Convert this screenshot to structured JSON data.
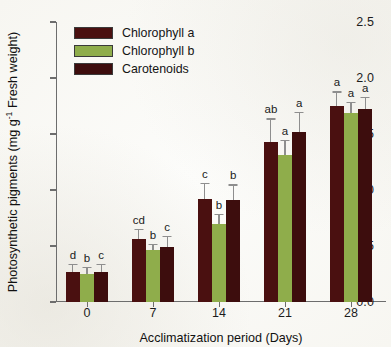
{
  "chart_data": {
    "type": "bar",
    "title": "",
    "xlabel": "Acclimatization period (Days)",
    "ylabel_text": "Photosynthetic pigments (mg g",
    "ylabel_sup": "-1",
    "ylabel_tail": " Fresh weight)",
    "categories": [
      "0",
      "7",
      "14",
      "21",
      "28"
    ],
    "ylim": [
      0.0,
      2.5
    ],
    "ytick_labels": [
      "0.0",
      "0.5",
      "1.0",
      "1.5",
      "2.0",
      "2.5"
    ],
    "ytick_values": [
      0.0,
      0.5,
      1.0,
      1.5,
      2.0,
      2.5
    ],
    "grid": false,
    "legend_position": "top-left-inside",
    "series": [
      {
        "name": "Chlorophyll a",
        "color": "#4a1010",
        "values": [
          0.27,
          0.56,
          0.92,
          1.43,
          1.75
        ],
        "errors": [
          0.07,
          0.09,
          0.14,
          0.21,
          0.13
        ],
        "letters": [
          "d",
          "cd",
          "c",
          "ab",
          "a"
        ]
      },
      {
        "name": "Chlorophyll b",
        "color": "#8fad4b",
        "values": [
          0.25,
          0.46,
          0.7,
          1.31,
          1.69
        ],
        "errors": [
          0.06,
          0.06,
          0.09,
          0.14,
          0.1
        ],
        "letters": [
          "b",
          "b",
          "b",
          "a",
          "a"
        ]
      },
      {
        "name": "Carotenoids",
        "color": "#3d0d0d",
        "values": [
          0.27,
          0.49,
          0.91,
          1.52,
          1.72
        ],
        "errors": [
          0.07,
          0.1,
          0.14,
          0.18,
          0.11
        ],
        "letters": [
          "c",
          "c",
          "b",
          "a",
          "a"
        ]
      }
    ]
  }
}
